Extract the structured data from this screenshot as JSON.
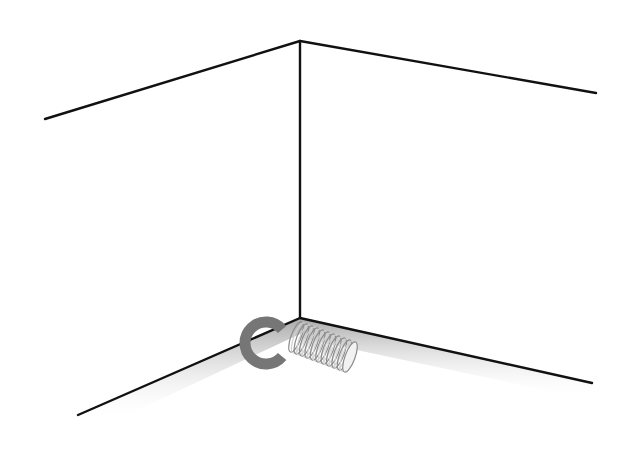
{
  "diagram": {
    "subject": "room-corner-with-spring-door-stop",
    "colors": {
      "background": "#ffffff",
      "edge_line": "#111111",
      "shadow_start": "#9a9a9a",
      "shadow_end": "#ffffff",
      "ring": "#767676",
      "spring_coil": "#8c8c8c",
      "spring_highlight": "#d0d0d0"
    },
    "geometry": {
      "ceiling_corner": [
        300,
        41
      ],
      "floor_corner": [
        300,
        318
      ],
      "ceiling_left_end": [
        45,
        119
      ],
      "ceiling_right_end": [
        596,
        93
      ],
      "floor_left_end": [
        78,
        415
      ],
      "floor_right_end": [
        592,
        383
      ],
      "ring_center": [
        266,
        343
      ],
      "ring_radius": 21,
      "ring_stroke": 11,
      "spring_start": [
        296,
        337
      ],
      "spring_end": [
        350,
        357
      ],
      "spring_radius": 16,
      "spring_coils": 20
    },
    "elements": [
      {
        "name": "ceiling-left-edge",
        "type": "line"
      },
      {
        "name": "ceiling-right-edge",
        "type": "line"
      },
      {
        "name": "vertical-wall-corner",
        "type": "line"
      },
      {
        "name": "floor-left-edge",
        "type": "line"
      },
      {
        "name": "floor-right-edge",
        "type": "line"
      },
      {
        "name": "c-ring-mount",
        "type": "ring"
      },
      {
        "name": "coil-spring",
        "type": "spring"
      }
    ]
  }
}
